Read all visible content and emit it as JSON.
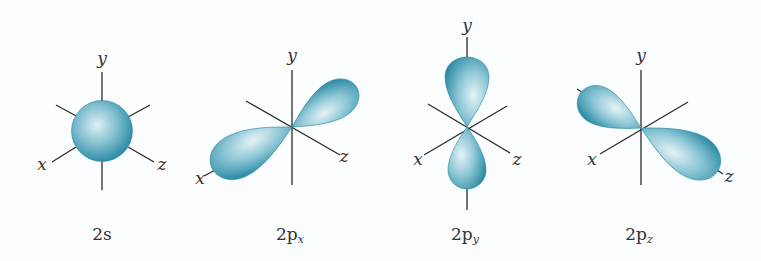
{
  "figure": {
    "orbitals": [
      {
        "id": "2s",
        "caption_main": "2s",
        "caption_sub": "",
        "axes": {
          "x": "x",
          "y": "y",
          "z": "z"
        }
      },
      {
        "id": "2px",
        "caption_main": "2p",
        "caption_sub": "x",
        "axes": {
          "x": "x",
          "y": "y",
          "z": "z"
        }
      },
      {
        "id": "2py",
        "caption_main": "2p",
        "caption_sub": "y",
        "axes": {
          "x": "x",
          "y": "y",
          "z": "z"
        }
      },
      {
        "id": "2pz",
        "caption_main": "2p",
        "caption_sub": "z",
        "axes": {
          "x": "x",
          "y": "y",
          "z": "z"
        }
      }
    ],
    "colors": {
      "orbital_dark": "#2a8aa3",
      "orbital_light": "#dff0f5",
      "axis": "#2b2b2b",
      "background": "#fbfdfe"
    }
  }
}
